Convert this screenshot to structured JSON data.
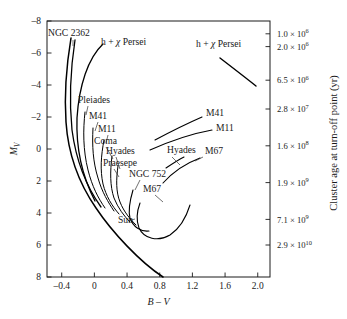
{
  "chart_data": {
    "type": "line",
    "title": "",
    "xlabel": "B – V",
    "ylabel": "M_V",
    "right_axis_label": "Cluster age at turn-off point (yr)",
    "xlim": [
      -0.58,
      2.15
    ],
    "ylim": [
      8,
      -8
    ],
    "y_inverted": true,
    "grid": false,
    "legend": "none",
    "xticks": [
      -0.4,
      0,
      0.4,
      0.8,
      1.2,
      1.6,
      2.0
    ],
    "xticklabels": [
      "–0.4",
      "0",
      "0.4",
      "0.8",
      "1.2",
      "1.6",
      "2.0"
    ],
    "yticks": [
      -8,
      -6,
      -4,
      -2,
      0,
      2,
      4,
      6,
      8
    ],
    "yticklabels": [
      "–8",
      "–6",
      "–4",
      "–2",
      "0",
      "2",
      "4",
      "6",
      "8"
    ],
    "right_ticks": [
      {
        "label": "1.0 × 10",
        "exp": "6",
        "mv": -7.2
      },
      {
        "label": "2.0 × 10",
        "exp": "6",
        "mv": -6.4
      },
      {
        "label": "6.5 × 10",
        "exp": "6",
        "mv": -4.3
      },
      {
        "label": "2.8 × 10",
        "exp": "7",
        "mv": -2.5
      },
      {
        "label": "1.6 × 10",
        "exp": "8",
        "mv": -0.2
      },
      {
        "label": "1.9 × 10",
        "exp": "9",
        "mv": 2.1
      },
      {
        "label": "7.1 × 10",
        "exp": "9",
        "mv": 4.4
      },
      {
        "label": "2.9 × 10",
        "exp": "10",
        "mv": 6.0
      }
    ],
    "annotations": [
      {
        "name": "NGC 2362",
        "text": "NGC 2362",
        "x": 48,
        "y": 36
      },
      {
        "name": "h-chi-persei-left",
        "text": "h + χ Persei",
        "x": 101,
        "y": 45
      },
      {
        "name": "h-chi-persei-right",
        "text": "h + χ Persei",
        "x": 196,
        "y": 47
      },
      {
        "name": "Pleiades",
        "text": "Pleiades",
        "x": 78,
        "y": 103
      },
      {
        "name": "M41-left",
        "text": "M41",
        "x": 89,
        "y": 119
      },
      {
        "name": "M11-left",
        "text": "M11",
        "x": 98,
        "y": 132
      },
      {
        "name": "Coma",
        "text": "Coma",
        "x": 94,
        "y": 144
      },
      {
        "name": "Hyades-left",
        "text": "Hyades",
        "x": 106,
        "y": 154
      },
      {
        "name": "Praesepe",
        "text": "Praesepe",
        "x": 103,
        "y": 166
      },
      {
        "name": "NGC 752",
        "text": "NGC 752",
        "x": 129,
        "y": 177
      },
      {
        "name": "M67-lower",
        "text": "M67",
        "x": 143,
        "y": 192
      },
      {
        "name": "Sun",
        "text": "Sun",
        "x": 118,
        "y": 223
      },
      {
        "name": "M41-right",
        "text": "M41",
        "x": 206,
        "y": 116
      },
      {
        "name": "M11-right",
        "text": "M11",
        "x": 216,
        "y": 131
      },
      {
        "name": "Hyades-right",
        "text": "Hyades",
        "x": 167,
        "y": 153
      },
      {
        "name": "M67-right",
        "text": "M67",
        "x": 205,
        "y": 154
      }
    ],
    "curves": [
      {
        "name": "main-sequence-envelope",
        "description": "Composite main sequence from NGC 2362 turn-off down to low-mass stars",
        "width": 1.5,
        "points": "M 71,38 C 67,62 64,92 66,122 C 68,152 78,182 96,208 C 112,232 140,262 163,277"
      },
      {
        "name": "ngc2362-branch",
        "description": "NGC 2362 isochrone upper main sequence",
        "width": 1.3,
        "points": "M 75,40 C 71,66 69,100 72,130 C 76,160 86,186 101,207"
      },
      {
        "name": "h-chi-persei-branch",
        "description": "h + chi Persei upper main sequence",
        "width": 1.3,
        "points": "M 103,44 C 88,58 79,86 77,118 C 76,146 82,176 95,201"
      },
      {
        "name": "pleiades-branch",
        "description": "Pleiades turn-off",
        "width": 1.0,
        "points": "M 85,112 C 83,130 83,150 88,170 C 92,186 98,198 105,208"
      },
      {
        "name": "m41-branch",
        "description": "M41 turn-off",
        "width": 1.0,
        "points": "M 93,128 C 92,146 93,162 98,178 C 102,192 108,202 114,211"
      },
      {
        "name": "m11-branch",
        "description": "M11 turn-off",
        "width": 1.0,
        "points": "M 104,140 C 101,156 100,170 103,184 C 106,196 112,206 119,214"
      },
      {
        "name": "coma-hyades-praesepe-branch",
        "description": "Coma / Hyades / Praesepe turn-offs",
        "width": 1.0,
        "points": "M 112,156 C 110,172 110,186 114,198 C 118,208 124,216 130,222"
      },
      {
        "name": "praesepe-branch",
        "description": "Praesepe turn-off inner",
        "width": 1.0,
        "points": "M 118,166 C 116,180 116,192 120,202 C 124,212 130,219 136,225"
      },
      {
        "name": "ngc752-branch",
        "description": "NGC 752 turn-off hook",
        "width": 1.1,
        "points": "M 133,190 C 130,200 128,210 130,218 C 133,227 141,232 149,231"
      },
      {
        "name": "m67-turnoff-branch",
        "description": "M67 turn-off and subgiant branch",
        "width": 1.1,
        "points": "M 140,203 C 137,211 136,220 139,228 C 144,239 158,242 170,235 C 179,229 186,218 190,205"
      },
      {
        "name": "m41-giant-branch",
        "description": "M41 red giant / supergiant branch",
        "width": 1.1,
        "points": "M 155,140 C 170,132 186,124 202,117"
      },
      {
        "name": "m11-giant-branch",
        "description": "M11 red giant branch",
        "width": 1.1,
        "points": "M 150,150 C 168,142 190,134 212,130"
      },
      {
        "name": "hyades-clump",
        "description": "Hyades red clump marker",
        "width": 1.1,
        "points": "M 166,168 C 172,164 178,160 184,157"
      },
      {
        "name": "m67-giant-branch",
        "description": "M67 red giant branch rising to the right",
        "width": 1.1,
        "points": "M 163,183 C 172,173 184,164 200,158"
      },
      {
        "name": "h-chi-persei-supergiants",
        "description": "h + chi Persei supergiant segment upper right",
        "width": 1.4,
        "points": "M 220,58 C 233,68 246,78 256,86"
      }
    ],
    "leaders": [
      {
        "name": "pleiades-leader",
        "points": "M 88,106 L 86,115"
      },
      {
        "name": "m41-leader",
        "points": "M 98,122 L 95,131"
      },
      {
        "name": "m11-leader",
        "points": "M 108,135 L 106,143"
      },
      {
        "name": "coma-leader",
        "points": "M 106,147 L 113,159"
      },
      {
        "name": "hyades-leader",
        "points": "M 116,157 L 120,169"
      },
      {
        "name": "praesepe-leader",
        "points": "M 114,169 L 119,177"
      },
      {
        "name": "ngc752-leader",
        "points": "M 140,180 L 135,190"
      },
      {
        "name": "m67-lower-leader",
        "points": "M 155,195 L 163,202"
      },
      {
        "name": "sun-leader",
        "points": "M 128,221 L 135,219"
      },
      {
        "name": "hyades-right-leader",
        "points": "M 172,157 L 180,165"
      },
      {
        "name": "m67-right-leader",
        "points": "M 203,157 L 195,161"
      },
      {
        "name": "ngc2362-leader",
        "points": "M 73,40 L 73,46"
      }
    ]
  },
  "figure": {
    "background_color": "#ffffff",
    "line_color": "#000000",
    "text_color": "#1a1a1a"
  }
}
